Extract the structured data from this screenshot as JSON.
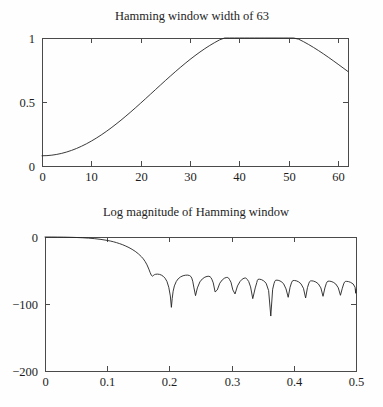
{
  "figure": {
    "background_color": "#fefefe",
    "axis_color": "#4a4a4a",
    "curve_color": "#242424"
  },
  "chart_data": [
    {
      "type": "line",
      "id": "hamming-window-time",
      "title": "Hamming window width of 63",
      "xlabel": "",
      "ylabel": "",
      "xlim": [
        0,
        62
      ],
      "ylim": [
        0,
        1
      ],
      "xticks": [
        0,
        10,
        20,
        30,
        40,
        50,
        60
      ],
      "xticklabels": [
        "0",
        "10",
        "20",
        "30",
        "40",
        "50",
        "60"
      ],
      "yticks": [
        0,
        0.5,
        1
      ],
      "yticklabels": [
        "0",
        "0.5",
        "1"
      ],
      "grid": false,
      "legend": false,
      "series": [
        {
          "name": "Hamming window w[n] = 0.54 - 0.46 cos(2*pi*n/62)",
          "x": [
            0,
            1,
            2,
            3,
            4,
            5,
            6,
            7,
            8,
            9,
            10,
            11,
            12,
            13,
            14,
            15,
            16,
            17,
            18,
            19,
            20,
            21,
            22,
            23,
            24,
            25,
            26,
            27,
            28,
            29,
            30,
            31,
            32,
            33,
            34,
            35,
            36,
            37,
            38,
            39,
            40,
            41,
            42,
            43,
            44,
            45,
            46,
            47,
            48,
            49,
            50,
            51,
            52,
            53,
            54,
            55,
            56,
            57,
            58,
            59,
            60,
            61,
            62
          ],
          "values": [
            0.08,
            0.0812,
            0.0847,
            0.0906,
            0.0988,
            0.1093,
            0.1221,
            0.137,
            0.1542,
            0.1734,
            0.1946,
            0.2177,
            0.2426,
            0.2692,
            0.2974,
            0.327,
            0.3579,
            0.39,
            0.423,
            0.4569,
            0.4914,
            0.5264,
            0.5617,
            0.5971,
            0.6324,
            0.6675,
            0.7021,
            0.7361,
            0.7692,
            0.8014,
            0.8324,
            0.8621,
            0.8903,
            0.9169,
            0.9418,
            0.9647,
            0.9856,
            1.0044,
            1.0208,
            1.035,
            1.0467,
            1.0559,
            1.0626,
            1.0667,
            1.0682,
            1.0671,
            1.0634,
            1.0572,
            1.0485,
            1.0374,
            1.024,
            1.0084,
            0.9907,
            0.9711,
            0.9497,
            0.9267,
            0.9023,
            0.8767,
            0.8501,
            0.8227,
            0.7947,
            0.7664,
            0.738
          ]
        }
      ]
    },
    {
      "type": "line",
      "id": "hamming-window-log-magnitude",
      "title": "Log magnitude of Hamming window",
      "xlabel": "",
      "ylabel": "",
      "xlim": [
        0,
        0.5
      ],
      "ylim": [
        -200,
        0
      ],
      "xticks": [
        0,
        0.1,
        0.2,
        0.3,
        0.4,
        0.5
      ],
      "xticklabels": [
        "0",
        "0.1",
        "0.2",
        "0.3",
        "0.4",
        "0.5"
      ],
      "yticks": [
        -200,
        -100,
        0
      ],
      "yticklabels": [
        "-200",
        "-100",
        "0"
      ],
      "grid": false,
      "legend": false,
      "annotations": [
        {
          "text": "mainlobe rolloff begins",
          "x": 0.12,
          "y": 0
        },
        {
          "text": "first sidelobe peak near -55 dB",
          "x": 0.183,
          "y": -55
        },
        {
          "text": "deep null",
          "x": 0.203,
          "y": -105
        },
        {
          "text": "deep null",
          "x": 0.341,
          "y": -118
        }
      ],
      "series": [
        {
          "name": "20*log10|W(f)| of Hamming window, width 63",
          "x": [
            0,
            0.01,
            0.02,
            0.03,
            0.04,
            0.05,
            0.06,
            0.07,
            0.08,
            0.09,
            0.1,
            0.105,
            0.11,
            0.115,
            0.12,
            0.125,
            0.13,
            0.135,
            0.14,
            0.145,
            0.15,
            0.155,
            0.158,
            0.161,
            0.164,
            0.167,
            0.169,
            0.171,
            0.1725,
            0.174,
            0.176,
            0.178,
            0.181,
            0.184,
            0.187,
            0.19,
            0.193,
            0.196,
            0.199,
            0.2015,
            0.2032,
            0.2045,
            0.206,
            0.208,
            0.211,
            0.214,
            0.218,
            0.222,
            0.226,
            0.2295,
            0.2325,
            0.2345,
            0.236,
            0.2375,
            0.2395,
            0.242,
            0.245,
            0.249,
            0.253,
            0.257,
            0.2605,
            0.2635,
            0.2655,
            0.2668,
            0.2682,
            0.2705,
            0.2735,
            0.277,
            0.281,
            0.285,
            0.2885,
            0.2915,
            0.2938,
            0.2952,
            0.2966,
            0.299,
            0.302,
            0.3055,
            0.3095,
            0.3135,
            0.317,
            0.32,
            0.3225,
            0.3238,
            0.3252,
            0.3275,
            0.3305,
            0.334,
            0.338,
            0.3405,
            0.3415,
            0.3425,
            0.345,
            0.348,
            0.3515,
            0.3555,
            0.3595,
            0.363,
            0.366,
            0.3682,
            0.3695,
            0.3708,
            0.373,
            0.376,
            0.3795,
            0.3835,
            0.3875,
            0.391,
            0.394,
            0.3962,
            0.3975,
            0.3988,
            0.401,
            0.404,
            0.4075,
            0.4115,
            0.4155,
            0.419,
            0.422,
            0.4242,
            0.4255,
            0.4268,
            0.429,
            0.432,
            0.4355,
            0.4395,
            0.4435,
            0.447,
            0.45,
            0.4522,
            0.4535,
            0.4548,
            0.457,
            0.46,
            0.4635,
            0.4675,
            0.4715,
            0.475,
            0.478,
            0.4802,
            0.4815,
            0.4828,
            0.485,
            0.488,
            0.4915,
            0.4955,
            0.4985,
            0.4995,
            0.5
          ],
          "values": [
            0,
            0,
            -0.1,
            -0.2,
            -0.4,
            -0.7,
            -1.1,
            -1.7,
            -2.5,
            -3.6,
            -5.1,
            -6.0,
            -7.1,
            -8.4,
            -9.9,
            -11.6,
            -13.6,
            -15.8,
            -18.4,
            -21.4,
            -25.0,
            -29.4,
            -32.6,
            -36.6,
            -41.6,
            -48.0,
            -53.0,
            -57.2,
            -58.5,
            -57.6,
            -56.2,
            -55.6,
            -55.4,
            -55.8,
            -56.8,
            -58.6,
            -61.5,
            -66.2,
            -75.0,
            -88.0,
            -105.0,
            -92.0,
            -81.0,
            -73.0,
            -66.5,
            -62.5,
            -59.5,
            -57.8,
            -57.0,
            -56.9,
            -57.6,
            -59.0,
            -61.4,
            -66.0,
            -76.0,
            -87.5,
            -76.0,
            -67.0,
            -62.5,
            -60.0,
            -58.8,
            -58.6,
            -59.4,
            -60.6,
            -63.0,
            -68.5,
            -82.0,
            -79.0,
            -69.0,
            -64.0,
            -61.5,
            -60.4,
            -60.4,
            -61.4,
            -63.4,
            -67.5,
            -79.0,
            -85.0,
            -73.0,
            -66.5,
            -63.0,
            -61.5,
            -61.2,
            -61.8,
            -63.4,
            -66.5,
            -74.5,
            -92.0,
            -76.0,
            -68.0,
            -64.5,
            -63.2,
            -63.0,
            -63.6,
            -65.4,
            -69.0,
            -80.0,
            -118.0,
            -78.0,
            -69.5,
            -66.0,
            -64.6,
            -64.4,
            -64.9,
            -66.4,
            -69.6,
            -77.5,
            -90.0,
            -75.0,
            -68.5,
            -65.9,
            -65.0,
            -64.9,
            -65.4,
            -66.8,
            -69.8,
            -76.5,
            -91.0,
            -75.5,
            -69.0,
            -66.5,
            -65.6,
            -65.4,
            -65.9,
            -67.2,
            -70.0,
            -76.0,
            -88.5,
            -76.0,
            -69.5,
            -67.0,
            -66.0,
            -65.9,
            -66.3,
            -67.6,
            -70.2,
            -75.8,
            -87.0,
            -76.5,
            -70.0,
            -67.4,
            -66.4,
            -66.2,
            -66.6,
            -67.8,
            -70.2,
            -75.0,
            -84.0,
            -78.0,
            -72.0,
            -68.0,
            -62.0,
            -62.0
          ]
        }
      ]
    }
  ]
}
